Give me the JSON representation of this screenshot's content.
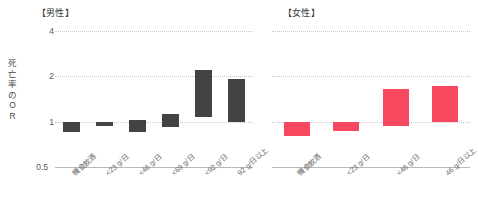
{
  "chart_data": {
    "type": "bar",
    "title": "",
    "ylabel": "死亡率のOR",
    "xlabel": "",
    "yscale": "log",
    "ylim": [
      0.5,
      4
    ],
    "yticks": [
      0.5,
      1,
      2,
      4
    ],
    "ytick_labels": [
      "0.5",
      "1",
      "2",
      "4"
    ],
    "grid": true,
    "reference_line": 1,
    "legend": "none",
    "panels": [
      {
        "name": "male",
        "title": "【男性】",
        "color": "#434345",
        "categories": [
          "機会飲酒",
          "<23 g/日",
          "<46 g/日",
          "<69 g/日",
          "<92 g/日",
          "92 g/日以上"
        ],
        "values": [
          0.85,
          0.93,
          1.03,
          1.13,
          2.21,
          1.92
        ],
        "baselines": [
          1.0,
          1.0,
          0.86,
          0.92,
          1.07,
          1.0
        ]
      },
      {
        "name": "female",
        "title": "【女性】",
        "color": "#F8485F",
        "categories": [
          "機会飲酒",
          "<23 g/日",
          "<46 g/日",
          "46 g/日以上"
        ],
        "values": [
          0.8,
          0.87,
          1.66,
          1.73
        ],
        "baselines": [
          1.0,
          1.0,
          0.93,
          1.0
        ]
      }
    ]
  },
  "axis": {
    "y_title_chars": [
      "死",
      "亡",
      "率",
      "の",
      "O",
      "R"
    ],
    "tick_4": "4",
    "tick_2": "2",
    "tick_1": "1",
    "tick_05": "0.5"
  }
}
